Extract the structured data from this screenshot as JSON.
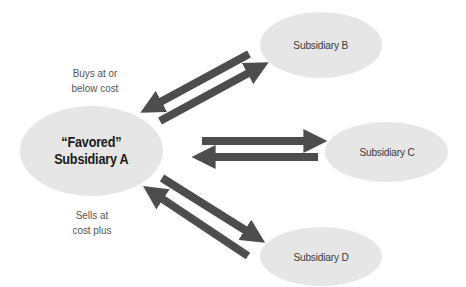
{
  "diagram": {
    "type": "transfer-pricing-flow",
    "nodes": {
      "a": {
        "label_line1": "“Favored”",
        "label_line2": "Subsidiary A"
      },
      "b": {
        "label": "Subsidiary B"
      },
      "c": {
        "label": "Subsidiary C"
      },
      "d": {
        "label": "Subsidiary D"
      }
    },
    "annotations": {
      "buys": {
        "line1": "Buys at or",
        "line2": "below cost"
      },
      "sells": {
        "line1": "Sells at",
        "line2": "cost plus"
      }
    },
    "edges": [
      {
        "from": "B",
        "to": "A"
      },
      {
        "from": "A",
        "to": "B"
      },
      {
        "from": "A",
        "to": "C"
      },
      {
        "from": "C",
        "to": "A"
      },
      {
        "from": "A",
        "to": "D"
      },
      {
        "from": "D",
        "to": "A"
      }
    ],
    "colors": {
      "ellipse_fill": "#e6e6e6",
      "arrow": "#4d4d4d",
      "text": "#3a3a3a"
    }
  }
}
